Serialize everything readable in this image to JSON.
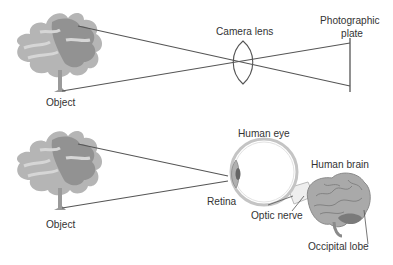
{
  "diagram": {
    "top_panel": {
      "object_label": "Object",
      "lens_label": "Camera lens",
      "plate_label_line1": "Photographic",
      "plate_label_line2": "plate"
    },
    "bottom_panel": {
      "object_label": "Object",
      "eye_label": "Human eye",
      "brain_label": "Human brain",
      "retina_label": "Retina",
      "optic_nerve_label": "Optic nerve",
      "occipital_lobe_label": "Occipital lobe"
    },
    "colors": {
      "line": "#555555",
      "tree_light": "#b5b5b5",
      "tree_dark": "#8e8e8e",
      "brain": "#a9a9a9",
      "occipital": "#7a7a7a",
      "text": "#333333"
    }
  }
}
